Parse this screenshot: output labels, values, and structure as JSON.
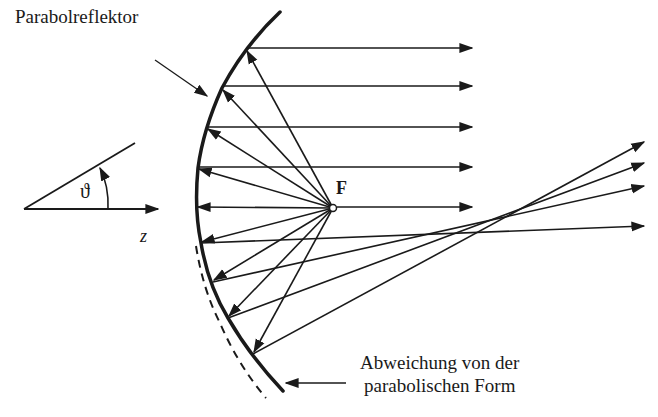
{
  "diagram": {
    "labels": {
      "reflector": "Parabolreflektor",
      "focus": "F",
      "angle": "ϑ",
      "axis": "z",
      "deviation_line1": "Abweichung von der",
      "deviation_line2": "parabolischen Form"
    },
    "colors": {
      "stroke": "#1a1a1a",
      "background": "#ffffff"
    },
    "focus_point": [
      333,
      208
    ],
    "reflector_points": [
      [
        280,
        12
      ],
      [
        247,
        49
      ],
      [
        222,
        88
      ],
      [
        207,
        127
      ],
      [
        198,
        168
      ],
      [
        196,
        207
      ],
      [
        201,
        243
      ],
      [
        213,
        282
      ],
      [
        228,
        318
      ],
      [
        253,
        354
      ],
      [
        283,
        391
      ]
    ],
    "parallel_rays_y": [
      48,
      86,
      127,
      167,
      207
    ],
    "deviated_rays": [
      {
        "from": [
          201,
          243
        ],
        "to": [
          643,
          226
        ]
      },
      {
        "from": [
          213,
          282
        ],
        "to": [
          643,
          186
        ]
      },
      {
        "from": [
          228,
          318
        ],
        "to": [
          643,
          163
        ]
      },
      {
        "from": [
          253,
          354
        ],
        "to": [
          643,
          142
        ]
      }
    ]
  }
}
